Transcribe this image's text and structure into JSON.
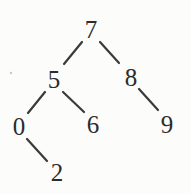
{
  "diagram": {
    "type": "binary-tree",
    "nodes": {
      "root": "7",
      "root_left": "5",
      "root_right": "8",
      "left_left": "0",
      "left_right": "6",
      "right_right": "9",
      "left_left_right": "2"
    },
    "edges": [
      {
        "from": "7",
        "to": "5"
      },
      {
        "from": "7",
        "to": "8"
      },
      {
        "from": "5",
        "to": "0"
      },
      {
        "from": "5",
        "to": "6"
      },
      {
        "from": "8",
        "to": "9"
      },
      {
        "from": "0",
        "to": "2"
      }
    ],
    "colors": {
      "background": "#fcfcfa",
      "ink": "#2c2c2c",
      "edge": "#3a3a3a"
    }
  }
}
